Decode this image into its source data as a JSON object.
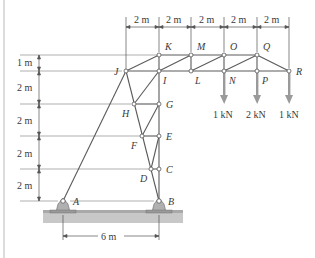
{
  "diagram": {
    "type": "truss",
    "top_dimensions": [
      "2 m",
      "2 m",
      "2 m",
      "2 m",
      "2 m"
    ],
    "left_dimensions": [
      "1 m",
      "2 m",
      "2 m",
      "2 m",
      "2 m"
    ],
    "bottom_dimension": "6 m",
    "nodes": {
      "A": "A",
      "B": "B",
      "C": "C",
      "D": "D",
      "E": "E",
      "F": "F",
      "G": "G",
      "H": "H",
      "I": "I",
      "J": "J",
      "K": "K",
      "L": "L",
      "M": "M",
      "N": "N",
      "O": "O",
      "P": "P",
      "Q": "Q",
      "R": "R"
    },
    "loads": [
      {
        "node": "N",
        "label": "1 kN"
      },
      {
        "node": "P",
        "label": "2 kN"
      },
      {
        "node": "R",
        "label": "1 kN"
      }
    ],
    "supports": [
      {
        "node": "A",
        "type": "pin"
      },
      {
        "node": "B",
        "type": "pin"
      }
    ]
  }
}
